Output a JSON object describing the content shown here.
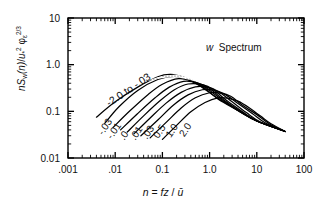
{
  "chart_data": {
    "type": "line",
    "title": "",
    "annotation": "w  Spectrum",
    "annotation_italic_part": "w",
    "annotation_rest": "Spectrum",
    "xlabel": "n = fz/u̅",
    "ylabel": "nSw(n)/u*² φε^(2/3)",
    "xscale": "log",
    "yscale": "log",
    "xlim": [
      0.001,
      100
    ],
    "ylim": [
      0.01,
      10
    ],
    "grid": false,
    "legend_position": "inline-curve-labels",
    "xticks": [
      0.001,
      0.01,
      0.1,
      1.0,
      10,
      100
    ],
    "xtick_labels": [
      ".001",
      ".01",
      "0.1",
      "1.0",
      "10",
      "100"
    ],
    "yticks": [
      0.01,
      0.1,
      1.0,
      10
    ],
    "ytick_labels": [
      "0.01",
      "0.1",
      "1.0",
      "10"
    ],
    "minor_ticks": true,
    "curve_label_group_top": "-2.0 to -.03",
    "curve_labels_bottom": [
      "-.03",
      "-.01",
      ".0",
      ".01",
      ".03",
      "0.5",
      "1.0",
      "2.0"
    ],
    "shaded_region_note": "stippled band near spectral peak",
    "series": [
      {
        "name": "-2.0 to -.03",
        "zL": -2.0,
        "x": [
          0.004,
          0.01,
          0.03,
          0.08,
          0.15,
          0.3,
          0.6,
          1.5,
          4,
          10,
          40
        ],
        "y": [
          0.075,
          0.16,
          0.33,
          0.55,
          0.62,
          0.52,
          0.36,
          0.19,
          0.105,
          0.062,
          0.037
        ]
      },
      {
        "name": "-.03b",
        "zL": -0.3,
        "x": [
          0.006,
          0.012,
          0.03,
          0.08,
          0.18,
          0.35,
          0.7,
          1.5,
          4,
          10,
          40
        ],
        "y": [
          0.055,
          0.125,
          0.28,
          0.48,
          0.56,
          0.48,
          0.34,
          0.185,
          0.104,
          0.062,
          0.037
        ]
      },
      {
        "name": "-.01",
        "zL": -0.1,
        "x": [
          0.009,
          0.02,
          0.05,
          0.1,
          0.22,
          0.45,
          0.8,
          1.8,
          4,
          10,
          40
        ],
        "y": [
          0.045,
          0.1,
          0.23,
          0.38,
          0.5,
          0.44,
          0.33,
          0.18,
          0.103,
          0.062,
          0.037
        ]
      },
      {
        "name": ".0",
        "zL": 0.0,
        "x": [
          0.013,
          0.03,
          0.07,
          0.14,
          0.28,
          0.55,
          1.0,
          2.0,
          4.5,
          10,
          40
        ],
        "y": [
          0.04,
          0.09,
          0.195,
          0.33,
          0.44,
          0.41,
          0.31,
          0.175,
          0.1,
          0.062,
          0.037
        ]
      },
      {
        "name": ".01",
        "zL": 0.01,
        "x": [
          0.018,
          0.04,
          0.09,
          0.18,
          0.35,
          0.7,
          1.2,
          2.3,
          5,
          10,
          40
        ],
        "y": [
          0.036,
          0.08,
          0.17,
          0.29,
          0.385,
          0.375,
          0.295,
          0.17,
          0.098,
          0.062,
          0.037
        ]
      },
      {
        "name": ".03",
        "zL": 0.03,
        "x": [
          0.025,
          0.055,
          0.12,
          0.25,
          0.5,
          0.9,
          1.5,
          3,
          6,
          12,
          40
        ],
        "y": [
          0.033,
          0.072,
          0.15,
          0.255,
          0.335,
          0.33,
          0.27,
          0.16,
          0.094,
          0.059,
          0.037
        ]
      },
      {
        "name": "0.5",
        "zL": 0.5,
        "x": [
          0.035,
          0.08,
          0.17,
          0.35,
          0.7,
          1.2,
          2.0,
          4,
          8,
          15,
          40
        ],
        "y": [
          0.03,
          0.065,
          0.135,
          0.225,
          0.29,
          0.285,
          0.24,
          0.148,
          0.09,
          0.057,
          0.037
        ]
      },
      {
        "name": "1.0",
        "zL": 1.0,
        "x": [
          0.055,
          0.12,
          0.25,
          0.5,
          1.0,
          1.7,
          2.8,
          5,
          10,
          18,
          40
        ],
        "y": [
          0.027,
          0.058,
          0.118,
          0.195,
          0.25,
          0.245,
          0.21,
          0.135,
          0.085,
          0.055,
          0.037
        ]
      },
      {
        "name": "2.0",
        "zL": 2.0,
        "x": [
          0.1,
          0.2,
          0.4,
          0.8,
          1.5,
          2.5,
          4,
          7,
          12,
          20,
          40
        ],
        "y": [
          0.025,
          0.05,
          0.098,
          0.155,
          0.195,
          0.19,
          0.165,
          0.118,
          0.079,
          0.054,
          0.037
        ]
      }
    ]
  },
  "axes": {
    "ylabel_parts": {
      "n": "n",
      "S": "S",
      "w": "w",
      "open": "(",
      "nvar": "n",
      "close": ")",
      "slash": "/",
      "u": "u",
      "star": "*",
      "sq": "2",
      "phi": "φ",
      "eps": "ε",
      "exp": "2/3"
    },
    "xlabel_parts": {
      "n": "n",
      "eq": " = ",
      "f": "f",
      "z": "z",
      "slash": "/",
      "ubar": "u̅"
    }
  }
}
